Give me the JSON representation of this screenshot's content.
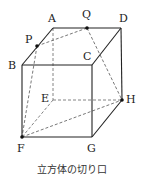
{
  "diagram": {
    "title": "立方体の切り口",
    "vertices": {
      "A": {
        "label": "A",
        "x": 53,
        "y": 28
      },
      "B": {
        "label": "B",
        "x": 22,
        "y": 65
      },
      "C": {
        "label": "C",
        "x": 92,
        "y": 65
      },
      "D": {
        "label": "D",
        "x": 121,
        "y": 28
      },
      "E": {
        "label": "E",
        "x": 53,
        "y": 100
      },
      "F": {
        "label": "F",
        "x": 22,
        "y": 137
      },
      "G": {
        "label": "G",
        "x": 92,
        "y": 137
      },
      "H": {
        "label": "H",
        "x": 122,
        "y": 100
      },
      "P": {
        "label": "P",
        "x": 37,
        "y": 46
      },
      "Q": {
        "label": "Q",
        "x": 87,
        "y": 28
      }
    },
    "solid_edges": [
      "AB",
      "AD",
      "BC",
      "CD",
      "BF",
      "CG",
      "FG",
      "DH",
      "GH",
      "AQ",
      "QD"
    ],
    "dashed_edges": [
      "AE",
      "EF",
      "EH",
      "PQ",
      "PF",
      "QH",
      "FH"
    ],
    "marked_points": [
      "P",
      "Q",
      "F",
      "H"
    ],
    "line_color": "#222222",
    "dash_color": "#555555"
  }
}
